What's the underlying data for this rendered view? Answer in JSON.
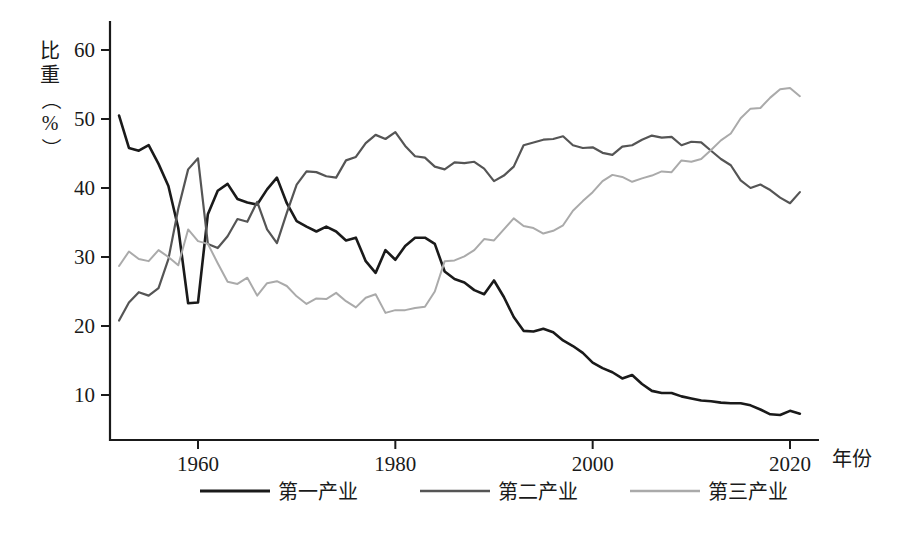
{
  "chart_data": {
    "type": "line",
    "title": "",
    "xlabel": "年份",
    "ylabel": "比重（%）",
    "ylabel_chars": [
      "比",
      "重",
      "（",
      "%",
      "）"
    ],
    "xlim": [
      1952,
      2021
    ],
    "ylim": [
      5,
      63
    ],
    "grid": false,
    "legend_position": "bottom",
    "x_ticks": [
      1960,
      1980,
      2000,
      2020
    ],
    "x_tick_labels": [
      "1960",
      "1980",
      "2000",
      "2020"
    ],
    "y_ticks": [
      10,
      20,
      30,
      40,
      50,
      60
    ],
    "y_tick_labels": [
      "10",
      "20",
      "30",
      "40",
      "50",
      "60"
    ],
    "x": [
      1952,
      1953,
      1954,
      1955,
      1956,
      1957,
      1958,
      1959,
      1960,
      1961,
      1962,
      1963,
      1964,
      1965,
      1966,
      1967,
      1968,
      1969,
      1970,
      1971,
      1972,
      1973,
      1974,
      1975,
      1976,
      1977,
      1978,
      1979,
      1980,
      1981,
      1982,
      1983,
      1984,
      1985,
      1986,
      1987,
      1988,
      1989,
      1990,
      1991,
      1992,
      1993,
      1994,
      1995,
      1996,
      1997,
      1998,
      1999,
      2000,
      2001,
      2002,
      2003,
      2004,
      2005,
      2006,
      2007,
      2008,
      2009,
      2010,
      2011,
      2012,
      2013,
      2014,
      2015,
      2016,
      2017,
      2018,
      2019,
      2020,
      2021
    ],
    "series": [
      {
        "name": "第一产业",
        "color": "#1a1a1a",
        "width": 2.6,
        "values": [
          50.5,
          45.8,
          45.4,
          46.2,
          43.5,
          40.3,
          34.2,
          23.3,
          23.4,
          36.2,
          39.6,
          40.6,
          38.4,
          37.9,
          37.6,
          39.8,
          41.5,
          37.8,
          35.2,
          34.4,
          33.7,
          34.4,
          33.7,
          32.4,
          32.8,
          29.4,
          27.7,
          31.0,
          29.6,
          31.6,
          32.8,
          32.8,
          31.9,
          27.9,
          26.8,
          26.3,
          25.2,
          24.6,
          26.6,
          24.2,
          21.3,
          19.3,
          19.2,
          19.6,
          19.1,
          17.9,
          17.1,
          16.1,
          14.7,
          13.9,
          13.3,
          12.4,
          12.9,
          11.6,
          10.6,
          10.3,
          10.3,
          9.8,
          9.5,
          9.2,
          9.1,
          8.9,
          8.8,
          8.8,
          8.5,
          7.9,
          7.2,
          7.1,
          7.7,
          7.3
        ]
      },
      {
        "name": "第二产业",
        "color": "#555555",
        "width": 2.2,
        "values": [
          20.8,
          23.4,
          24.9,
          24.4,
          25.5,
          29.7,
          37.0,
          42.7,
          44.3,
          31.9,
          31.3,
          33.0,
          35.5,
          35.1,
          38.0,
          34.0,
          32.0,
          36.4,
          40.5,
          42.4,
          42.3,
          41.7,
          41.5,
          44.0,
          44.5,
          46.5,
          47.7,
          47.1,
          48.1,
          46.1,
          44.6,
          44.4,
          43.1,
          42.7,
          43.7,
          43.6,
          43.8,
          42.8,
          41.0,
          41.8,
          43.1,
          46.2,
          46.6,
          47.0,
          47.1,
          47.5,
          46.2,
          45.8,
          45.9,
          45.1,
          44.8,
          46.0,
          46.2,
          47.0,
          47.6,
          47.3,
          47.4,
          46.2,
          46.7,
          46.6,
          45.4,
          44.2,
          43.3,
          41.1,
          40.0,
          40.5,
          39.7,
          38.6,
          37.8,
          39.4
        ]
      },
      {
        "name": "第三产业",
        "color": "#aaaaaa",
        "width": 2.0,
        "values": [
          28.7,
          30.8,
          29.7,
          29.4,
          31.0,
          30.0,
          28.8,
          34.0,
          32.3,
          31.9,
          29.1,
          26.4,
          26.1,
          27.0,
          24.4,
          26.2,
          26.5,
          25.8,
          24.3,
          23.2,
          24.0,
          23.9,
          24.8,
          23.6,
          22.7,
          24.1,
          24.6,
          21.9,
          22.3,
          22.3,
          22.6,
          22.8,
          25.0,
          29.4,
          29.5,
          30.1,
          31.0,
          32.6,
          32.4,
          34.0,
          35.6,
          34.5,
          34.2,
          33.4,
          33.8,
          34.6,
          36.7,
          38.1,
          39.4,
          41.0,
          41.9,
          41.6,
          40.9,
          41.4,
          41.8,
          42.4,
          42.3,
          44.0,
          43.8,
          44.2,
          45.5,
          46.9,
          47.9,
          50.1,
          51.5,
          51.6,
          53.1,
          54.3,
          54.5,
          53.3
        ]
      }
    ]
  },
  "legend": {
    "items": [
      {
        "label": "第一产业",
        "color": "#1a1a1a"
      },
      {
        "label": "第二产业",
        "color": "#555555"
      },
      {
        "label": "第三产业",
        "color": "#aaaaaa"
      }
    ]
  }
}
